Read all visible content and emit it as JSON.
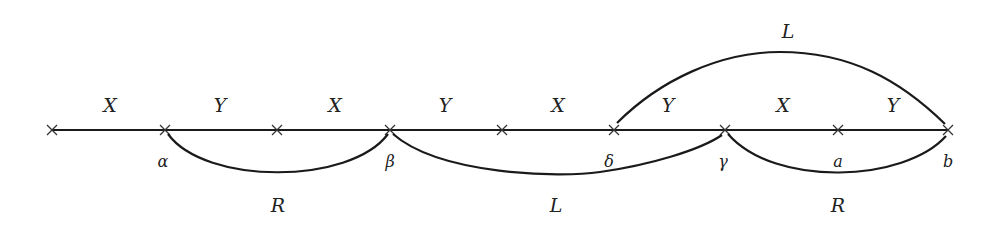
{
  "diagram": {
    "type": "number-line-with-arcs",
    "baseline": {
      "y": 130,
      "x_start": 52,
      "x_end": 948
    },
    "ticks": [
      52,
      165,
      277,
      390,
      502,
      614,
      725,
      838,
      948
    ],
    "segment_labels": [
      {
        "text": "X",
        "x": 110
      },
      {
        "text": "Y",
        "x": 220
      },
      {
        "text": "X",
        "x": 335
      },
      {
        "text": "Y",
        "x": 445
      },
      {
        "text": "X",
        "x": 558
      },
      {
        "text": "Y",
        "x": 668
      },
      {
        "text": "X",
        "x": 783
      },
      {
        "text": "Y",
        "x": 893
      }
    ],
    "point_labels": [
      {
        "text": "α",
        "x": 163
      },
      {
        "text": "β",
        "x": 390
      },
      {
        "text": "δ",
        "x": 609
      },
      {
        "text": "γ",
        "x": 723
      },
      {
        "text": "a",
        "x": 838
      },
      {
        "text": "b",
        "x": 948
      }
    ],
    "arcs": [
      {
        "label": "R",
        "from": "α",
        "to": "β",
        "side": "below",
        "label_x": 278,
        "label_y": 212
      },
      {
        "label": "L",
        "from": "β",
        "to": "γ",
        "side": "below",
        "label_x": 556,
        "label_y": 212
      },
      {
        "label": "R",
        "from": "γ",
        "to": "b",
        "side": "below",
        "label_x": 838,
        "label_y": 212
      },
      {
        "label": "L",
        "from": "δ",
        "to": "b",
        "side": "above",
        "label_x": 788,
        "label_y": 38
      }
    ]
  }
}
